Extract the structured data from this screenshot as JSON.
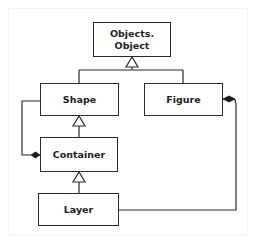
{
  "diagram": {
    "type": "uml-class-diagram",
    "colors": {
      "line": "#2a2a2a",
      "text": "#222222",
      "background": "#ffffff"
    },
    "classes": [
      {
        "id": "objects-object",
        "label_line1": "Objects.",
        "label_line2": "Object"
      },
      {
        "id": "shape",
        "label": "Shape"
      },
      {
        "id": "figure",
        "label": "Figure"
      },
      {
        "id": "container",
        "label": "Container"
      },
      {
        "id": "layer",
        "label": "Layer"
      }
    ],
    "relationships": [
      {
        "type": "generalization",
        "from": "Shape",
        "to": "Objects.Object"
      },
      {
        "type": "generalization",
        "from": "Figure",
        "to": "Objects.Object"
      },
      {
        "type": "generalization",
        "from": "Container",
        "to": "Shape"
      },
      {
        "type": "generalization",
        "from": "Layer",
        "to": "Container"
      },
      {
        "type": "composition",
        "whole": "Container",
        "part": "Shape"
      },
      {
        "type": "composition",
        "whole": "Figure",
        "part": "Layer"
      }
    ]
  }
}
